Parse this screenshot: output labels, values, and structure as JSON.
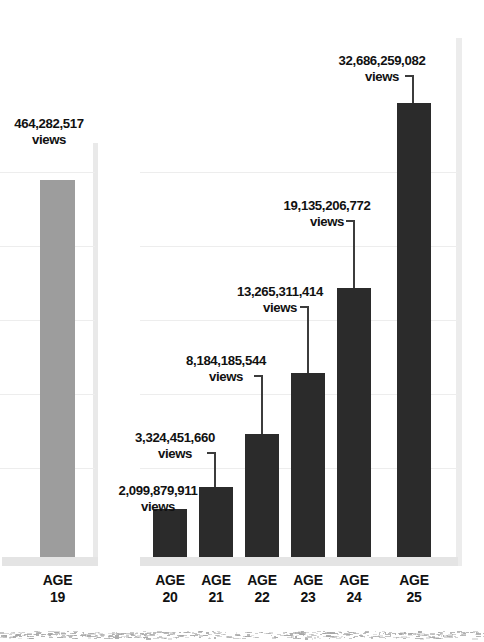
{
  "chart_data": {
    "type": "bar",
    "title": "",
    "xlabel": "",
    "ylabel": "",
    "grid": true,
    "legend": "none",
    "categories": [
      "AGE 19",
      "AGE 20",
      "AGE 21",
      "AGE 22",
      "AGE 23",
      "AGE 24",
      "AGE 25"
    ],
    "values": [
      464282517,
      2099879911,
      3324451660,
      8184185544,
      13265311414,
      19135206772,
      32686259082
    ],
    "value_labels": [
      "464,282,517",
      "2,099,879,911",
      "3,324,451,660",
      "8,184,185,544",
      "13,265,311,414",
      "19,135,206,772",
      "32,686,259,082"
    ],
    "unit_label": "views",
    "ylim": [
      0,
      36000000000
    ],
    "series": [
      {
        "name": "views",
        "values": [
          464282517,
          2099879911,
          3324451660,
          8184185544,
          13265311414,
          19135206772,
          32686259082
        ]
      }
    ]
  },
  "colors": {
    "bar_dark": "#2b2b2b",
    "bar_gray": "#9d9d9d",
    "gridline": "#ededed",
    "baseline": "#e4e4e4",
    "panel_edge": "#ececec",
    "text": "#111111",
    "leader": "#3c3c3c",
    "background": "#ffffff"
  },
  "bars": [
    {
      "age_word": "AGE",
      "age_number": "19",
      "value_label": "464,282,517",
      "unit": "views"
    },
    {
      "age_word": "AGE",
      "age_number": "20",
      "value_label": "2,099,879,911",
      "unit": "views"
    },
    {
      "age_word": "AGE",
      "age_number": "21",
      "value_label": "3,324,451,660",
      "unit": "views"
    },
    {
      "age_word": "AGE",
      "age_number": "22",
      "value_label": "8,184,185,544",
      "unit": "views"
    },
    {
      "age_word": "AGE",
      "age_number": "23",
      "value_label": "13,265,311,414",
      "unit": "views"
    },
    {
      "age_word": "AGE",
      "age_number": "24",
      "value_label": "19,135,206,772",
      "unit": "views"
    },
    {
      "age_word": "AGE",
      "age_number": "25",
      "value_label": "32,686,259,082",
      "unit": "views"
    }
  ]
}
